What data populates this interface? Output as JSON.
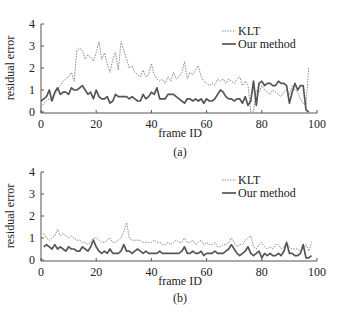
{
  "chart_data": [
    {
      "type": "line",
      "panel_label": "(a)",
      "title": "",
      "xlabel": "frame ID",
      "ylabel": "residual error",
      "xlim": [
        0,
        100
      ],
      "ylim": [
        0,
        4
      ],
      "xticks": [
        "0",
        "20",
        "40",
        "60",
        "80",
        "100"
      ],
      "yticks": [
        "0",
        "1",
        "2",
        "3",
        "4"
      ],
      "grid": false,
      "legend_position": "upper right",
      "series": [
        {
          "name": "KLT",
          "style": "dotted",
          "color": "#888888",
          "x": [
            0,
            1,
            2,
            3,
            4,
            5,
            6,
            7,
            8,
            9,
            10,
            11,
            12,
            13,
            14,
            15,
            16,
            17,
            18,
            19,
            20,
            21,
            22,
            23,
            24,
            25,
            26,
            27,
            28,
            29,
            30,
            31,
            32,
            33,
            34,
            35,
            36,
            37,
            38,
            39,
            40,
            41,
            42,
            43,
            44,
            45,
            46,
            47,
            48,
            49,
            50,
            51,
            52,
            53,
            54,
            55,
            56,
            57,
            58,
            59,
            60,
            61,
            62,
            63,
            64,
            65,
            66,
            67,
            68,
            69,
            70,
            71,
            72,
            73,
            74,
            75,
            76,
            77,
            78,
            79,
            80,
            81,
            82,
            83,
            84,
            85,
            86,
            87,
            88,
            89,
            90,
            91,
            92,
            93,
            94,
            95,
            96,
            97
          ],
          "values": [
            0.2,
            0.4,
            0.5,
            0.6,
            0.5,
            0.8,
            1.0,
            1.2,
            1.4,
            1.5,
            1.6,
            1.8,
            1.4,
            2.8,
            2.9,
            2.8,
            2.4,
            2.6,
            2.5,
            2.3,
            2.7,
            3.2,
            2.4,
            2.7,
            2.2,
            1.8,
            2.4,
            2.7,
            1.9,
            3.2,
            2.8,
            2.4,
            2.0,
            2.1,
            1.8,
            1.7,
            1.6,
            1.9,
            1.6,
            1.7,
            2.2,
            1.7,
            1.5,
            1.4,
            1.5,
            1.3,
            1.6,
            1.4,
            1.8,
            1.5,
            1.6,
            1.8,
            2.3,
            1.5,
            1.8,
            1.7,
            1.9,
            2.1,
            1.6,
            1.4,
            1.3,
            1.2,
            1.3,
            1.2,
            1.5,
            1.4,
            1.5,
            1.3,
            1.5,
            1.4,
            1.3,
            1.5,
            1.6,
            1.2,
            1.4,
            1.2,
            0.0,
            0.0,
            1.0,
            0.9,
            1.2,
            1.0,
            0.9,
            0.8,
            1.0,
            0.9,
            0.8,
            0.7,
            0.9,
            1.0,
            0.8,
            1.2,
            1.0,
            0.9,
            0.6,
            0.4,
            0.3,
            2.0
          ]
        },
        {
          "name": "Our method",
          "style": "solid",
          "color": "#555555",
          "x": [
            0,
            1,
            2,
            3,
            4,
            5,
            6,
            7,
            8,
            9,
            10,
            11,
            12,
            13,
            14,
            15,
            16,
            17,
            18,
            19,
            20,
            21,
            22,
            23,
            24,
            25,
            26,
            27,
            28,
            29,
            30,
            31,
            32,
            33,
            34,
            35,
            36,
            37,
            38,
            39,
            40,
            41,
            42,
            43,
            44,
            45,
            46,
            47,
            48,
            49,
            50,
            51,
            52,
            53,
            54,
            55,
            56,
            57,
            58,
            59,
            60,
            61,
            62,
            63,
            64,
            65,
            66,
            67,
            68,
            69,
            70,
            71,
            72,
            73,
            74,
            75,
            76,
            77,
            78,
            79,
            80,
            81,
            82,
            83,
            84,
            85,
            86,
            87,
            88,
            89,
            90,
            91,
            92,
            93,
            94,
            95,
            96,
            97
          ],
          "values": [
            0.5,
            0.6,
            0.7,
            1.0,
            0.5,
            0.9,
            1.1,
            0.8,
            0.9,
            0.9,
            0.8,
            1.1,
            1.0,
            1.0,
            1.1,
            1.2,
            1.0,
            0.8,
            0.9,
            0.6,
            1.0,
            0.7,
            0.6,
            0.6,
            0.7,
            0.4,
            0.5,
            0.8,
            0.7,
            0.7,
            0.7,
            0.7,
            0.6,
            0.7,
            0.6,
            0.5,
            0.5,
            0.8,
            0.6,
            0.7,
            0.9,
            0.8,
            1.1,
            0.6,
            0.6,
            0.6,
            0.8,
            0.8,
            0.8,
            0.7,
            0.6,
            0.5,
            0.4,
            0.6,
            0.6,
            0.5,
            0.6,
            0.5,
            0.6,
            0.4,
            0.6,
            0.5,
            0.5,
            0.6,
            0.8,
            1.0,
            0.9,
            0.7,
            0.6,
            0.6,
            0.5,
            0.6,
            0.6,
            0.4,
            0.7,
            0.3,
            0.5,
            1.4,
            0.3,
            1.3,
            1.4,
            1.2,
            1.3,
            1.3,
            1.2,
            1.2,
            1.4,
            1.3,
            1.3,
            1.2,
            0.4,
            0.9,
            1.3,
            1.0,
            1.2,
            1.2,
            0.1,
            0.0
          ]
        }
      ]
    },
    {
      "type": "line",
      "panel_label": "(b)",
      "title": "",
      "xlabel": "frame ID",
      "ylabel": "residual error",
      "xlim": [
        0,
        100
      ],
      "ylim": [
        0,
        4
      ],
      "xticks": [
        "0",
        "20",
        "40",
        "60",
        "80",
        "100"
      ],
      "yticks": [
        "0",
        "1",
        "2",
        "3",
        "4"
      ],
      "grid": false,
      "legend_position": "upper right",
      "series": [
        {
          "name": "KLT",
          "style": "dotted",
          "color": "#888888",
          "x": [
            1,
            2,
            3,
            4,
            5,
            6,
            7,
            8,
            9,
            10,
            11,
            12,
            13,
            14,
            15,
            16,
            17,
            18,
            19,
            20,
            21,
            22,
            23,
            24,
            25,
            26,
            27,
            28,
            29,
            30,
            31,
            32,
            33,
            34,
            35,
            36,
            37,
            38,
            39,
            40,
            41,
            42,
            43,
            44,
            45,
            46,
            47,
            48,
            49,
            50,
            51,
            52,
            53,
            54,
            55,
            56,
            57,
            58,
            59,
            60,
            61,
            62,
            63,
            64,
            65,
            66,
            67,
            68,
            69,
            70,
            71,
            72,
            73,
            74,
            75,
            76,
            77,
            78,
            79,
            80,
            81,
            82,
            83,
            84,
            85,
            86,
            87,
            88,
            89,
            90,
            91,
            92,
            93,
            94,
            95,
            96,
            97,
            98
          ],
          "values": [
            1.2,
            1.0,
            0.9,
            1.0,
            1.1,
            1.4,
            1.1,
            1.2,
            1.1,
            1.0,
            1.1,
            1.0,
            0.9,
            0.9,
            0.8,
            0.8,
            0.7,
            0.8,
            1.0,
            1.0,
            0.9,
            0.8,
            0.8,
            0.9,
            1.0,
            0.8,
            0.8,
            0.9,
            1.0,
            1.3,
            1.7,
            1.0,
            0.9,
            0.9,
            0.9,
            0.9,
            0.8,
            0.8,
            0.8,
            0.8,
            0.9,
            0.8,
            0.8,
            0.7,
            0.7,
            0.8,
            0.7,
            0.8,
            0.9,
            0.8,
            0.8,
            1.0,
            0.8,
            0.8,
            0.9,
            0.7,
            0.8,
            0.9,
            0.7,
            0.8,
            0.7,
            0.7,
            0.8,
            0.6,
            0.6,
            0.7,
            0.7,
            0.8,
            1.0,
            0.8,
            0.6,
            0.7,
            0.7,
            0.9,
            1.0,
            1.1,
            0.6,
            0.5,
            0.7,
            0.8,
            0.6,
            0.5,
            0.6,
            0.5,
            0.7,
            0.7,
            0.5,
            0.6,
            0.8,
            0.6,
            0.5,
            0.5,
            0.5,
            0.4,
            0.5,
            0.7,
            0.4,
            0.8
          ]
        },
        {
          "name": "Our method",
          "style": "solid",
          "color": "#555555",
          "x": [
            1,
            2,
            3,
            4,
            5,
            6,
            7,
            8,
            9,
            10,
            11,
            12,
            13,
            14,
            15,
            16,
            17,
            18,
            19,
            20,
            21,
            22,
            23,
            24,
            25,
            26,
            27,
            28,
            29,
            30,
            31,
            32,
            33,
            34,
            35,
            36,
            37,
            38,
            39,
            40,
            41,
            42,
            43,
            44,
            45,
            46,
            47,
            48,
            49,
            50,
            51,
            52,
            53,
            54,
            55,
            56,
            57,
            58,
            59,
            60,
            61,
            62,
            63,
            64,
            65,
            66,
            67,
            68,
            69,
            70,
            71,
            72,
            73,
            74,
            75,
            76,
            77,
            78,
            79,
            80,
            81,
            82,
            83,
            84,
            85,
            86,
            87,
            88,
            89,
            90,
            91,
            92,
            93,
            94,
            95,
            96,
            97,
            98
          ],
          "values": [
            0.6,
            0.7,
            0.6,
            0.5,
            0.7,
            0.5,
            0.6,
            0.5,
            0.4,
            0.6,
            0.5,
            0.5,
            0.4,
            0.4,
            0.6,
            0.5,
            0.4,
            0.6,
            0.9,
            0.6,
            0.4,
            0.3,
            0.4,
            0.3,
            0.5,
            0.3,
            0.3,
            0.3,
            0.4,
            0.7,
            0.4,
            0.4,
            0.3,
            0.4,
            0.5,
            0.4,
            0.3,
            0.4,
            0.3,
            0.3,
            0.3,
            0.3,
            0.4,
            0.3,
            0.3,
            0.3,
            0.3,
            0.3,
            0.3,
            0.3,
            0.4,
            0.6,
            0.3,
            0.3,
            0.4,
            0.3,
            0.3,
            0.4,
            0.2,
            0.3,
            0.3,
            0.3,
            0.4,
            0.3,
            0.3,
            0.3,
            0.4,
            0.5,
            0.7,
            0.5,
            0.3,
            0.2,
            0.3,
            0.4,
            0.6,
            0.3,
            0.2,
            0.3,
            0.4,
            0.1,
            0.3,
            0.2,
            0.3,
            0.2,
            0.2,
            0.3,
            0.2,
            0.4,
            0.8,
            0.3,
            0.3,
            0.2,
            0.2,
            0.3,
            0.7,
            0.1,
            0.1,
            0.2
          ]
        }
      ]
    }
  ],
  "panels": [
    {
      "label": "(a)",
      "xlabel": "frame ID",
      "ylabel": "residual error",
      "legend": [
        "KLT",
        "Our method"
      ]
    },
    {
      "label": "(b)",
      "xlabel": "frame ID",
      "ylabel": "residual error",
      "legend": [
        "KLT",
        "Our method"
      ]
    }
  ]
}
